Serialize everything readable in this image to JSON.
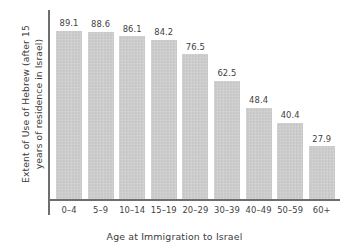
{
  "chart_data": {
    "type": "bar",
    "title": "",
    "subtitle": "",
    "xlabel": "Age at Immigration to Israel",
    "ylabel_line1": "Extent of Use of Hebrew (after 15",
    "ylabel_line2": "years of residence in Israel)",
    "ylabel": "Extent of Use of Hebrew (after 15 years of residence in Israel)",
    "categories": [
      "0–4",
      "5–9",
      "10–14",
      "15–19",
      "20–29",
      "30–39",
      "40–49",
      "50–59",
      "60+"
    ],
    "values": [
      89.1,
      88.6,
      86.1,
      84.2,
      76.5,
      62.5,
      48.4,
      40.4,
      27.9
    ],
    "value_labels": [
      "89.1",
      "88.6",
      "86.1",
      "84.2",
      "76.5",
      "62.5",
      "48.4",
      "40.4",
      "27.9"
    ],
    "ylim": [
      0,
      100
    ],
    "grid": false,
    "legend": false,
    "legend_position": "none",
    "y_ticks_visible": false,
    "x_ticks_visible": false,
    "bar_color": "#c9c9c9",
    "axis_color": "#6e6e6e",
    "text_color": "#3f3f3f",
    "background_color": "#ffffff"
  }
}
